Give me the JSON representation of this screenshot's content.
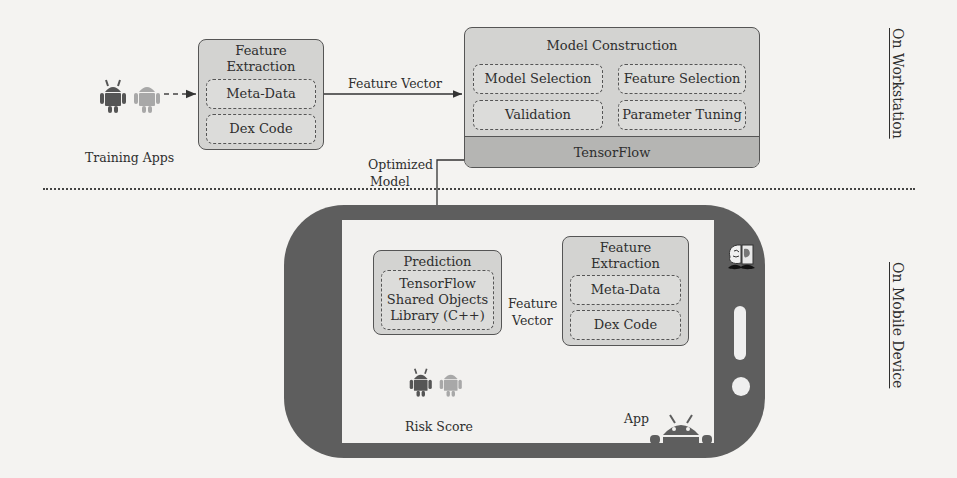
{
  "workstation": {
    "side_label": "On Workstation",
    "training_apps_label": "Training Apps",
    "feature_extraction": {
      "title_line1": "Feature",
      "title_line2": "Extraction",
      "items": [
        "Meta-Data",
        "Dex Code"
      ]
    },
    "edge_feature_vector": "Feature Vector",
    "model_construction": {
      "title": "Model Construction",
      "items": [
        "Model Selection",
        "Feature Selection",
        "Validation",
        "Parameter Tuning"
      ],
      "framework": "TensorFlow"
    },
    "edge_optimized_model_line1": "Optimized",
    "edge_optimized_model_line2": "Model"
  },
  "mobile": {
    "side_label": "On Mobile Device",
    "prediction": {
      "title": "Prediction",
      "lines": [
        "TensorFlow",
        "Shared Objects",
        "Library (C++)"
      ]
    },
    "edge_feature_vector_line1": "Feature",
    "edge_feature_vector_line2": "Vector",
    "feature_extraction": {
      "title_line1": "Feature",
      "title_line2": "Extraction",
      "items": [
        "Meta-Data",
        "Dex Code"
      ]
    },
    "risk_score_label": "Risk Score",
    "app_label": "App"
  },
  "icons": {
    "malicious_android": "android-malware-icon",
    "benign_android": "android-benign-icon",
    "brain_mustache_logo": "brain-mustache-icon",
    "android_peek": "android-head-icon"
  },
  "colors": {
    "box_fill": "#d3d3d1",
    "framework_bar": "#b5b5b3",
    "phone_body": "#5e5e5e",
    "malicious_android": "#555555",
    "benign_android": "#a8a8a8"
  }
}
